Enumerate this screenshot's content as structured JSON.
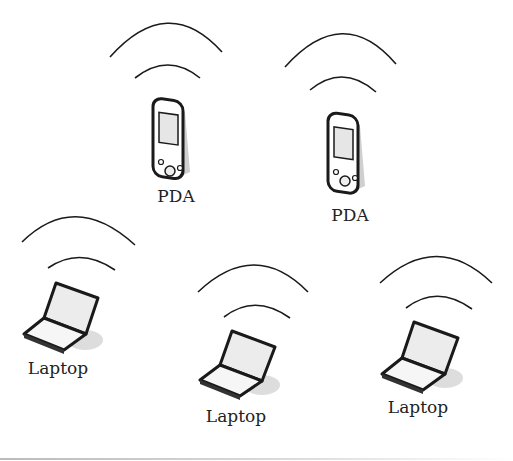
{
  "diagram": {
    "nodes": [
      {
        "id": "pda-1",
        "type": "PDA",
        "label": "PDA",
        "x": 170,
        "y": 140,
        "wave_cx": 168,
        "wave_cy": 80
      },
      {
        "id": "pda-2",
        "type": "PDA",
        "label": "PDA",
        "x": 345,
        "y": 150,
        "wave_cx": 343,
        "wave_cy": 92
      },
      {
        "id": "laptop-1",
        "type": "Laptop",
        "label": "Laptop",
        "x": 60,
        "y": 312,
        "wave_cx": 72,
        "wave_cy": 262
      },
      {
        "id": "laptop-2",
        "type": "Laptop",
        "label": "Laptop",
        "x": 235,
        "y": 352,
        "wave_cx": 250,
        "wave_cy": 300
      },
      {
        "id": "laptop-3",
        "type": "Laptop",
        "label": "Laptop",
        "x": 417,
        "y": 346,
        "wave_cx": 432,
        "wave_cy": 292
      }
    ],
    "colors": {
      "stroke": "#1a1a1a",
      "screen": "#e8e8e8",
      "shadow": "#d0d0d0",
      "text": "#222222"
    }
  }
}
